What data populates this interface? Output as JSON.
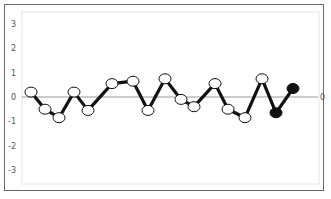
{
  "chart_data": {
    "type": "line",
    "title": "",
    "xlabel": "",
    "ylabel": "",
    "ylim": [
      -3.5,
      3.5
    ],
    "yticks": [
      3,
      2,
      1,
      0,
      -1,
      -2,
      -3
    ],
    "ytick_labels": [
      "3",
      "2",
      "1",
      "0",
      "-1",
      "-2",
      "-3"
    ],
    "right_label": "0",
    "grid": false,
    "legend": null,
    "reference_line": 0,
    "series": [
      {
        "name": "series",
        "x": [
          1,
          2,
          3,
          4,
          5,
          6,
          7,
          8,
          9,
          10,
          11,
          12,
          13,
          14,
          15,
          16,
          17
        ],
        "values": [
          0.2,
          -0.5,
          -0.85,
          0.2,
          -0.55,
          0.55,
          0.65,
          -0.55,
          0.75,
          -0.1,
          -0.4,
          0.55,
          -0.5,
          -0.85,
          0.75,
          -0.65,
          0.35
        ],
        "marker_fill": [
          "white",
          "white",
          "white",
          "white",
          "white",
          "white",
          "white",
          "white",
          "white",
          "white",
          "white",
          "white",
          "white",
          "white",
          "white",
          "black",
          "black"
        ],
        "line_color": "#111111"
      }
    ],
    "px_x": [
      31,
      45,
      59,
      74,
      88,
      112,
      133,
      148,
      165,
      181,
      194,
      215,
      228,
      245,
      262,
      276,
      293
    ]
  },
  "colors": {
    "frame": "#6a6a6a",
    "inner_frame": "#e4e4e4",
    "zero_line": "#999999",
    "line": "#111111",
    "marker_open": "#ffffff",
    "marker_filled": "#111111",
    "tick_text": "#555555"
  }
}
